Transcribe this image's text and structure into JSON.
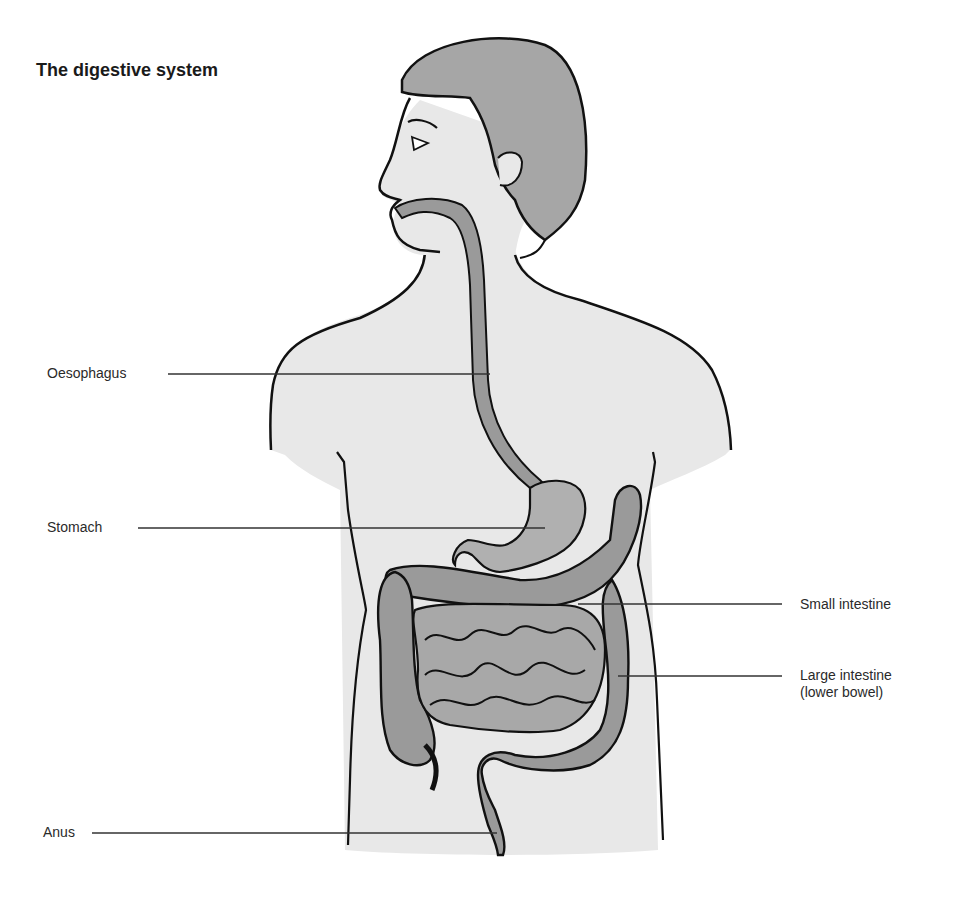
{
  "title": "The digestive system",
  "labels": {
    "oesophagus": "Oesophagus",
    "stomach": "Stomach",
    "small_intestine": "Small intestine",
    "large_intestine_line1": "Large intestine",
    "large_intestine_line2": "(lower bowel)",
    "anus": "Anus"
  },
  "colors": {
    "skin": "#e8e8e8",
    "hair": "#a6a6a6",
    "organ": "#9a9a9a",
    "organ_light": "#b8b8b8",
    "outline": "#111111",
    "leader": "#333333"
  }
}
